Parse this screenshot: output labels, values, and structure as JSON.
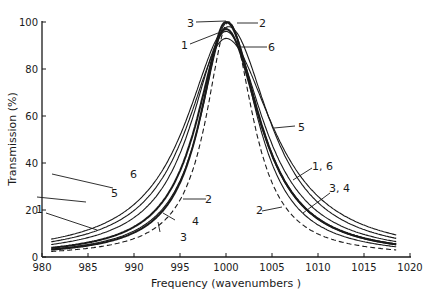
{
  "chart_data": {
    "type": "line",
    "title": "",
    "xlabel": "Frequency (wavenumbers )",
    "ylabel": "Transmission (%)",
    "xlim": [
      980,
      1020
    ],
    "ylim": [
      0,
      100
    ],
    "x_ticks": [
      980,
      985,
      990,
      995,
      1000,
      1005,
      1010,
      1015,
      1020
    ],
    "y_ticks": [
      0,
      20,
      40,
      60,
      80,
      100
    ],
    "grid": false,
    "legend": "none (curves labelled directly with numbers 1-6)",
    "series": [
      {
        "name": "1",
        "style": "solid",
        "center": 1000.0,
        "peak": 96,
        "hwhm_left": 4.6,
        "hwhm_right": 5.0
      },
      {
        "name": "2",
        "style": "solid",
        "center": 1000.2,
        "peak": 100,
        "hwhm_left": 3.6,
        "hwhm_right": 3.9
      },
      {
        "name": "3",
        "style": "solid-bold",
        "center": 1000.0,
        "peak": 100,
        "hwhm_left": 3.4,
        "hwhm_right": 4.4
      },
      {
        "name": "4",
        "style": "solid-bold",
        "center": 1000.0,
        "peak": 97,
        "hwhm_left": 3.9,
        "hwhm_right": 4.5
      },
      {
        "name": "5",
        "style": "solid",
        "center": 1000.0,
        "peak": 93,
        "hwhm_left": 5.2,
        "hwhm_right": 6.2
      },
      {
        "name": "6",
        "style": "solid",
        "center": 1000.3,
        "peak": 98,
        "hwhm_left": 5.6,
        "hwhm_right": 5.4
      },
      {
        "name": "dashed",
        "style": "dashed",
        "center": 1000.3,
        "peak": 100,
        "hwhm_left": 3.0,
        "hwhm_right": 3.2
      }
    ],
    "x_range_plotted": [
      981,
      1018.5
    ],
    "annotations": [
      "1",
      "2",
      "3",
      "4",
      "5",
      "6",
      "1, 6",
      "3, 4",
      "2"
    ]
  },
  "labels": {
    "xlabel": "Frequency (wavenumbers )",
    "ylabel": "Transmission (%)",
    "x_ticks": [
      "980",
      "985",
      "990",
      "995",
      "1000",
      "1005",
      "1010",
      "1015",
      "1020"
    ],
    "y_ticks": [
      "0",
      "20",
      "40",
      "60",
      "80",
      "100"
    ],
    "annotations": {
      "a1_left": "1",
      "a5_left": "5",
      "a6_left": "6",
      "a2_left": "2",
      "a4_left": "4",
      "a3_left": "3",
      "a3_top": "3",
      "a2_top": "2",
      "a1_top": "1",
      "a6_top": "6",
      "a5_right": "5",
      "a16_right": "1, 6",
      "a34_right": "3, 4",
      "a2_right": "2"
    }
  }
}
